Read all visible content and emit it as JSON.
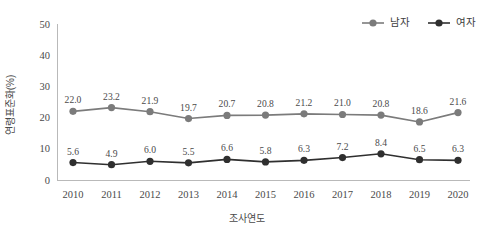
{
  "chart_data": {
    "type": "line",
    "title": "",
    "xlabel": "조사연도",
    "ylabel": "연령표준화(%)",
    "categories": [
      "2010",
      "2011",
      "2012",
      "2013",
      "2014",
      "2015",
      "2016",
      "2017",
      "2018",
      "2019",
      "2020"
    ],
    "ylim": [
      0,
      50
    ],
    "yticks": [
      "0",
      "10",
      "20",
      "30",
      "40",
      "50"
    ],
    "grid": false,
    "legend_position": "top-right",
    "series": [
      {
        "name": "남자",
        "color": "#7b7b7b",
        "marker": "circle",
        "values": [
          22.0,
          23.2,
          21.9,
          19.7,
          20.7,
          20.8,
          21.2,
          21.0,
          20.8,
          18.6,
          21.6
        ],
        "labels": [
          "22.0",
          "23.2",
          "21.9",
          "19.7",
          "20.7",
          "20.8",
          "21.2",
          "21.0",
          "20.8",
          "18.6",
          "21.6"
        ]
      },
      {
        "name": "여자",
        "color": "#2f2f2f",
        "marker": "circle",
        "values": [
          5.6,
          4.9,
          6.0,
          5.5,
          6.6,
          5.8,
          6.3,
          7.2,
          8.4,
          6.5,
          6.3
        ],
        "labels": [
          "5.6",
          "4.9",
          "6.0",
          "5.5",
          "6.6",
          "5.8",
          "6.3",
          "7.2",
          "8.4",
          "6.5",
          "6.3"
        ]
      }
    ]
  },
  "legend": {
    "items": [
      {
        "label": "남자",
        "color": "#7b7b7b"
      },
      {
        "label": "여자",
        "color": "#2f2f2f"
      }
    ]
  },
  "colors": {
    "male": "#7b7b7b",
    "female": "#2f2f2f",
    "axis": "#b9b9b9",
    "text": "#4a4a4a",
    "background": "#ffffff"
  }
}
